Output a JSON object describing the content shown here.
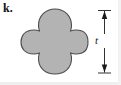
{
  "figure": {
    "item_label": "k.",
    "shape": {
      "icon_name": "quatrefoil-shape",
      "description": "quatrefoil",
      "fill_color": "#b3b3b3",
      "stroke_color": "#4d4d4d",
      "center_x": 55,
      "center_y": 42,
      "top_y": 9,
      "bottom_y": 74,
      "left_x": 21,
      "right_x": 88
    },
    "dimension": {
      "label": "t",
      "icon_name": "dimension-arrow-vertical",
      "orientation": "vertical",
      "line_x": 104,
      "top_y": 10,
      "bottom_y": 73,
      "extension_left_x": 98,
      "extension_right_x": 111,
      "color": "#1a1a1a"
    },
    "background_color": "#ffffff"
  }
}
